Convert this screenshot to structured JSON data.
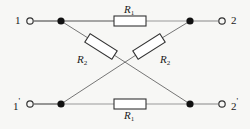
{
  "figure": {
    "kind": "circuit-diagram",
    "name": "lattice-network",
    "background_color": "#f7f7f5",
    "line_color": "#4a4a4a",
    "node_color": "#111111",
    "text_color": "#1a1a1a"
  },
  "terminals": [
    {
      "id": "1",
      "label": "1",
      "prime": "",
      "x": 30,
      "y": 21,
      "position": "top-left"
    },
    {
      "id": "2",
      "label": "2",
      "prime": "",
      "x": 222,
      "y": 21,
      "position": "top-right"
    },
    {
      "id": "1p",
      "label": "1",
      "prime": "'",
      "x": 30,
      "y": 104,
      "position": "bottom-left"
    },
    {
      "id": "2p",
      "label": "2",
      "prime": "'",
      "x": 222,
      "y": 104,
      "position": "bottom-right"
    }
  ],
  "nodes": [
    {
      "id": "n-tl",
      "x": 61,
      "y": 21
    },
    {
      "id": "n-tr",
      "x": 190,
      "y": 21
    },
    {
      "id": "n-bl",
      "x": 61,
      "y": 104
    },
    {
      "id": "n-br",
      "x": 190,
      "y": 104
    }
  ],
  "resistors": [
    {
      "id": "r1-top",
      "label": "R",
      "subscript": "1",
      "orientation": "horizontal",
      "between": [
        "n-tl",
        "n-tr"
      ]
    },
    {
      "id": "r1-bottom",
      "label": "R",
      "subscript": "1",
      "orientation": "horizontal",
      "between": [
        "n-bl",
        "n-br"
      ]
    },
    {
      "id": "r2-left",
      "label": "R",
      "subscript": "2",
      "orientation": "diagonal",
      "between": [
        "n-tl",
        "n-br"
      ]
    },
    {
      "id": "r2-right",
      "label": "R",
      "subscript": "2",
      "orientation": "diagonal",
      "between": [
        "n-bl",
        "n-tr"
      ]
    }
  ],
  "labels": {
    "term_1": "1",
    "term_2": "2",
    "term_1_prime_base": "1",
    "term_1_prime_mark": "'",
    "term_2_prime_base": "2",
    "term_2_prime_mark": "'",
    "r1_top_base": "R",
    "r1_top_sub": "1",
    "r1_bottom_base": "R",
    "r1_bottom_sub": "1",
    "r2_left_base": "R",
    "r2_left_sub": "2",
    "r2_right_base": "R",
    "r2_right_sub": "2"
  }
}
